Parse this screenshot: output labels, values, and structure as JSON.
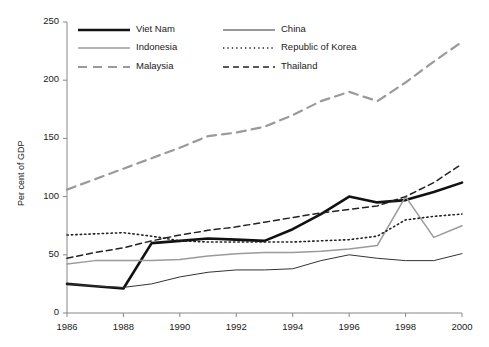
{
  "chart_data": {
    "type": "line",
    "title": "",
    "xlabel": "",
    "ylabel": "Per cent of GDP",
    "xlim": [
      1986,
      2000
    ],
    "ylim": [
      0,
      250
    ],
    "yticks": [
      0,
      50,
      100,
      150,
      200,
      250
    ],
    "xticks": [
      1986,
      1988,
      1990,
      1992,
      1994,
      1996,
      1998,
      2000
    ],
    "xtick_labels": [
      "1986",
      "1988",
      "1990",
      "1992",
      "1994",
      "1996",
      "1998",
      "2000"
    ],
    "ytick_labels": [
      "0",
      "50",
      "100",
      "150",
      "200",
      "250"
    ],
    "grid": false,
    "legend_position": "top-inside",
    "x": [
      1986,
      1987,
      1988,
      1989,
      1990,
      1991,
      1992,
      1993,
      1994,
      1995,
      1996,
      1997,
      1998,
      1999,
      2000
    ],
    "series": [
      {
        "name": "Viet Nam",
        "color": "#111111",
        "style": "solid",
        "width": 2.6,
        "values": [
          25,
          23,
          21,
          60,
          62,
          64,
          63,
          62,
          72,
          85,
          100,
          95,
          97,
          104,
          112
        ]
      },
      {
        "name": "China",
        "color": "#333333",
        "style": "solid",
        "width": 1.0,
        "values": [
          25,
          23,
          22,
          25,
          31,
          35,
          37,
          37,
          38,
          45,
          50,
          47,
          45,
          45,
          51
        ]
      },
      {
        "name": "Indonesia",
        "color": "#9a9a9a",
        "style": "solid",
        "width": 1.5,
        "values": [
          42,
          45,
          45,
          45,
          46,
          49,
          51,
          52,
          52,
          53,
          55,
          58,
          100,
          65,
          75
        ]
      },
      {
        "name": "Republic of Korea",
        "color": "#222222",
        "style": "dotted",
        "width": 1.6,
        "values": [
          67,
          68,
          69,
          66,
          62,
          61,
          61,
          61,
          61,
          62,
          63,
          66,
          80,
          83,
          85
        ]
      },
      {
        "name": "Malaysia",
        "color": "#9a9a9a",
        "style": "dashed-long",
        "width": 2.2,
        "values": [
          106,
          115,
          124,
          133,
          142,
          152,
          155,
          160,
          170,
          182,
          190,
          182,
          198,
          216,
          233
        ]
      },
      {
        "name": "Thailand",
        "color": "#222222",
        "style": "dashed",
        "width": 1.5,
        "values": [
          47,
          52,
          56,
          62,
          67,
          71,
          74,
          78,
          82,
          86,
          89,
          92,
          100,
          112,
          128
        ]
      }
    ],
    "legend": [
      {
        "label": "Viet Nam",
        "style": "solid",
        "color": "#111111",
        "width": 2.6
      },
      {
        "label": "China",
        "style": "solid",
        "color": "#333333",
        "width": 1.0
      },
      {
        "label": "Indonesia",
        "style": "solid",
        "color": "#9a9a9a",
        "width": 1.5
      },
      {
        "label": "Republic of Korea",
        "style": "dotted",
        "color": "#222222",
        "width": 1.6
      },
      {
        "label": "Malaysia",
        "style": "dashed-long",
        "color": "#9a9a9a",
        "width": 2.2
      },
      {
        "label": "Thailand",
        "style": "dashed",
        "color": "#222222",
        "width": 1.5
      }
    ]
  }
}
